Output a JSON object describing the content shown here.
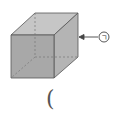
{
  "figure": {
    "shape": "cuboid",
    "label": "ㄱ",
    "label_target": "right-face",
    "answer_blank": "("
  },
  "colors": {
    "front_face": "#a9a9a9",
    "top_face": "#c4c4c4",
    "side_face": "#b6b6b6",
    "edge": "#555555",
    "hidden_edge": "#777777"
  }
}
